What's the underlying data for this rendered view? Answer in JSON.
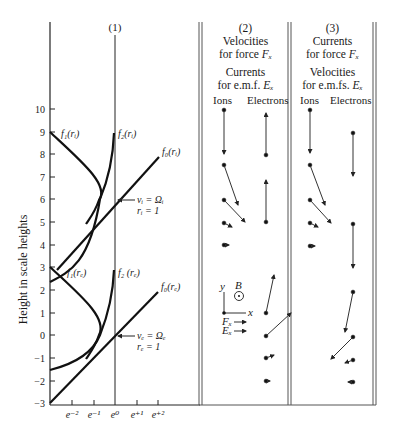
{
  "panel1": {
    "label": "(1)",
    "y_axis_label": "Height in scale heights",
    "y_ticks": [
      "10",
      "9",
      "8",
      "7",
      "6",
      "5",
      "4",
      "3",
      "2",
      "1",
      "0",
      "−1",
      "−2",
      "−3"
    ],
    "x_ticks": [
      "e⁻²",
      "e⁻¹",
      "e⁰",
      "e⁺¹",
      "e⁺²"
    ],
    "ion_curves": {
      "f1": "f₁(rᵢ)",
      "f2": "f₂(rᵢ)",
      "f0": "f₀(rᵢ)",
      "annotation_line1": "νᵢ = Ωᵢ",
      "annotation_line2": "rᵢ = 1"
    },
    "electron_curves": {
      "f1": "f₁(rₑ)",
      "f2": "f₂ (rₑ)",
      "f0": "f₀(rₑ)",
      "annotation_line1": "νₑ = Ωₑ",
      "annotation_line2": "rₑ = 1"
    }
  },
  "panel2": {
    "label": "(2)",
    "line1": "Velocities",
    "line2_prefix": "for force ",
    "line2_var": "Fₓ",
    "line3": "Currents",
    "line4_prefix": "for e.m.f. ",
    "line4_var": "Eₓ",
    "col_ions": "Ions",
    "col_electrons": "Electrons",
    "axes_legend": {
      "y": "y",
      "x": "x",
      "b": "B",
      "force": "Fₓ",
      "emf": "Eₓ"
    }
  },
  "panel3": {
    "label": "(3)",
    "line1": "Currents",
    "line2_prefix": "for force ",
    "line2_var": "Fₓ",
    "line3": "Velocities",
    "line4_prefix": "for e.m.fs. ",
    "line4_var": "Eₓ",
    "col_ions": "Ions",
    "col_electrons": "Electrons"
  }
}
